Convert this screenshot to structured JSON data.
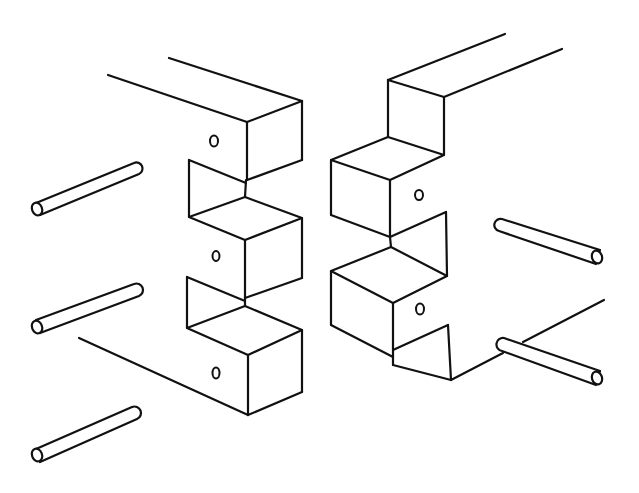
{
  "figure": {
    "title": "Pinned finger (box) joint, exploded view",
    "style": "black line drawing on white",
    "colors": {
      "line": "#111111",
      "background": "#ffffff"
    },
    "parts": {
      "left_member": {
        "fingers": 3,
        "holes": 3
      },
      "right_member": {
        "fingers": 2,
        "holes": 2
      },
      "pins_left": 3,
      "pins_right": 2
    }
  }
}
